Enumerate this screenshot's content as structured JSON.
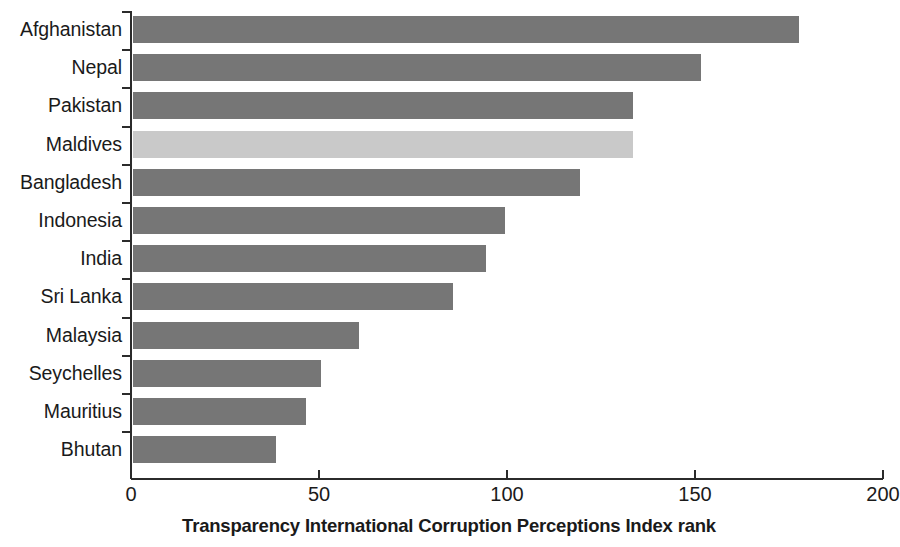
{
  "chart_data": {
    "type": "bar",
    "orientation": "horizontal",
    "title": "",
    "xlabel": "Transparency International Corruption Perceptions Index rank",
    "ylabel": "",
    "xlim": [
      0,
      200
    ],
    "xticks": [
      0,
      50,
      100,
      150,
      200
    ],
    "xtick_labels": [
      "0",
      "50",
      "100",
      "150",
      "200"
    ],
    "grid": false,
    "legend": false,
    "categories": [
      "Afghanistan",
      "Nepal",
      "Pakistan",
      "Maldives",
      "Bangladesh",
      "Indonesia",
      "India",
      "Sri Lanka",
      "Malaysia",
      "Seychelles",
      "Mauritius",
      "Bhutan"
    ],
    "values": [
      177,
      151,
      133,
      133,
      119,
      99,
      94,
      85,
      60,
      50,
      46,
      38
    ],
    "bar_colors": [
      "#767676",
      "#767676",
      "#767676",
      "#c9c9c9",
      "#767676",
      "#767676",
      "#767676",
      "#767676",
      "#767676",
      "#767676",
      "#767676",
      "#767676"
    ],
    "colors": {
      "bar_default": "#767676",
      "bar_highlight": "#c9c9c9",
      "axis": "#2b2b2b",
      "text": "#1a1a1a",
      "background": "#ffffff"
    }
  }
}
